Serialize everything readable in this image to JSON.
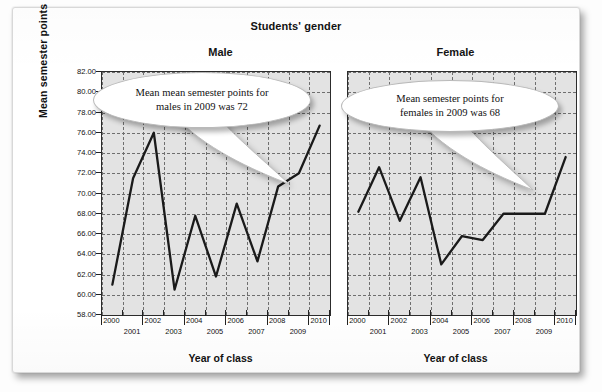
{
  "figure": {
    "title": "Students' gender",
    "y_axis_title": "Mean semester points",
    "x_axis_title": "Year of class"
  },
  "panels": [
    {
      "key": "male",
      "title": "Male",
      "x_axis_title": "Year of class"
    },
    {
      "key": "female",
      "title": "Female",
      "x_axis_title": "Year of class"
    }
  ],
  "callouts": [
    {
      "key": "male",
      "line1": "Mean mean semester points for",
      "line2": "males in 2009 was 72"
    },
    {
      "key": "female",
      "line1": "Mean semester points for",
      "line2": "females in 2009 was 68"
    }
  ],
  "axis": {
    "y_ticks": [
      "58.00",
      "60.00",
      "62.00",
      "64.00",
      "66.00",
      "68.00",
      "70.00",
      "72.00",
      "74.00",
      "76.00",
      "78.00",
      "80.00",
      "82.00"
    ],
    "x_ticks": [
      "2000",
      "2001",
      "2002",
      "2003",
      "2004",
      "2005",
      "2006",
      "2007",
      "2008",
      "2009",
      "2010"
    ]
  },
  "colors": {
    "line": "#1a1a1a",
    "plot_background": "#e3e3e3",
    "grid": "#6f6f6f",
    "frame": "#2c2c2c",
    "paper": "#ffffff"
  },
  "chart_data": {
    "type": "line",
    "title": "Students' gender",
    "xlabel": "Year of class",
    "ylabel": "Mean semester points",
    "x": [
      2000,
      2001,
      2002,
      2003,
      2004,
      2005,
      2006,
      2007,
      2008,
      2009,
      2010
    ],
    "ylim": [
      58,
      82
    ],
    "ytick_step": 2,
    "grid": true,
    "legend": "none",
    "panels": [
      {
        "name": "Male",
        "values": [
          61.0,
          71.5,
          76.0,
          60.5,
          67.8,
          61.8,
          69.0,
          63.3,
          70.7,
          72.0,
          76.7
        ],
        "annotation": "Mean mean semester points for males in 2009 was 72"
      },
      {
        "name": "Female",
        "values": [
          68.2,
          72.6,
          67.3,
          71.6,
          63.0,
          65.8,
          65.4,
          68.0,
          68.0,
          68.0,
          73.6
        ],
        "annotation": "Mean semester points for females in 2009 was 68"
      }
    ]
  }
}
